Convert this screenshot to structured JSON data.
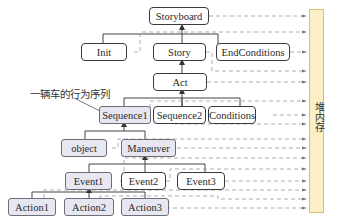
{
  "diagram": {
    "type": "tree-with-memory-references",
    "nodes": [
      {
        "id": "storyboard",
        "label": "Storyboard",
        "style": "white"
      },
      {
        "id": "init",
        "label": "Init",
        "style": "white"
      },
      {
        "id": "story",
        "label": "Story",
        "style": "white"
      },
      {
        "id": "endconditions",
        "label": "EndConditions",
        "style": "white"
      },
      {
        "id": "act",
        "label": "Act",
        "style": "white"
      },
      {
        "id": "sequence1",
        "label": "Sequence1",
        "style": "shaded"
      },
      {
        "id": "sequence2",
        "label": "Sequence2",
        "style": "white"
      },
      {
        "id": "conditions",
        "label": "Conditions",
        "style": "white"
      },
      {
        "id": "object",
        "label": "object",
        "style": "shaded"
      },
      {
        "id": "maneuver",
        "label": "Maneuver",
        "style": "shaded"
      },
      {
        "id": "event1",
        "label": "Event1",
        "style": "shaded"
      },
      {
        "id": "event2",
        "label": "Event2",
        "style": "white"
      },
      {
        "id": "event3",
        "label": "Event3",
        "style": "white"
      },
      {
        "id": "action1",
        "label": "Action1",
        "style": "shaded"
      },
      {
        "id": "action2",
        "label": "Action2",
        "style": "shaded"
      },
      {
        "id": "action3",
        "label": "Action3",
        "style": "shaded"
      }
    ],
    "edges": [
      [
        "storyboard",
        "init"
      ],
      [
        "storyboard",
        "story"
      ],
      [
        "storyboard",
        "endconditions"
      ],
      [
        "story",
        "act"
      ],
      [
        "act",
        "sequence1"
      ],
      [
        "act",
        "sequence2"
      ],
      [
        "act",
        "conditions"
      ],
      [
        "sequence1",
        "object"
      ],
      [
        "sequence1",
        "maneuver"
      ],
      [
        "maneuver",
        "event1"
      ],
      [
        "maneuver",
        "event2"
      ],
      [
        "maneuver",
        "event3"
      ],
      [
        "event1",
        "action1"
      ],
      [
        "event1",
        "action2"
      ],
      [
        "event1",
        "action3"
      ]
    ],
    "annotation": "一辆车的行为序列",
    "annotation_target": "sequence1",
    "memory_label": "堆内存",
    "colors": {
      "node_border": "#3a3a3a",
      "shaded_fill": "#e6e7f1",
      "heap_fill": "#fbefc5",
      "heap_border": "#d5be78",
      "dash_line": "#9a9a9a"
    }
  }
}
